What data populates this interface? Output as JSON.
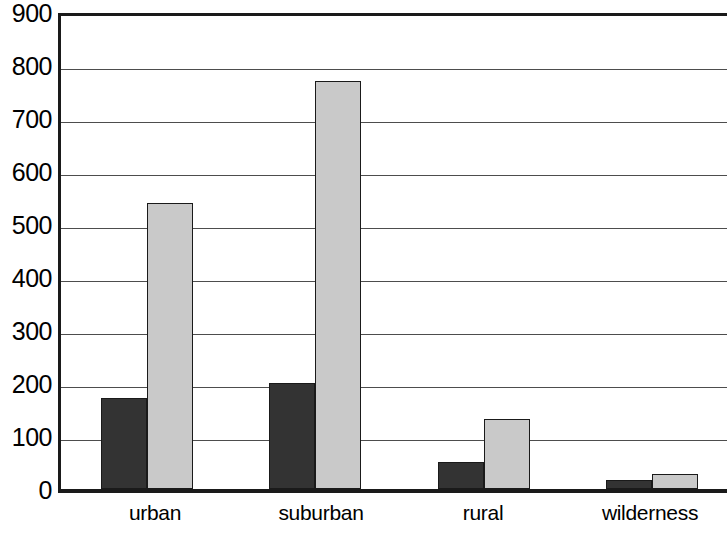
{
  "chart_data": {
    "type": "bar",
    "title": "",
    "subtitle": "",
    "xlabel": "",
    "ylabel": "",
    "categories": [
      "urban",
      "suburban",
      "rural",
      "wilderness"
    ],
    "series": [
      {
        "name": "series-a",
        "color": "#333333",
        "values": [
          172,
          200,
          50,
          17
        ]
      },
      {
        "name": "series-b",
        "color": "#c9c9c9",
        "values": [
          540,
          770,
          132,
          28
        ]
      }
    ],
    "ylim": [
      0,
      900
    ],
    "ytick_labels": [
      "900",
      "800",
      "700",
      "600",
      "500",
      "400",
      "300",
      "200",
      "100",
      "0"
    ],
    "ytick_values": [
      900,
      800,
      700,
      600,
      500,
      400,
      300,
      200,
      100,
      0
    ],
    "ytick_interval": 100,
    "grid": true,
    "grid_axis": "y",
    "legend": false,
    "legend_position": "none",
    "axis_color": "#1a1a1a",
    "gridline_color": "#4d4d4d",
    "background": "#ffffff",
    "annotations": []
  },
  "axes": {
    "y_labels": [
      "900",
      "800",
      "700",
      "600",
      "500",
      "400",
      "300",
      "200",
      "100",
      "0"
    ],
    "x_labels": [
      "urban",
      "suburban",
      "rural",
      "wilderness"
    ]
  }
}
